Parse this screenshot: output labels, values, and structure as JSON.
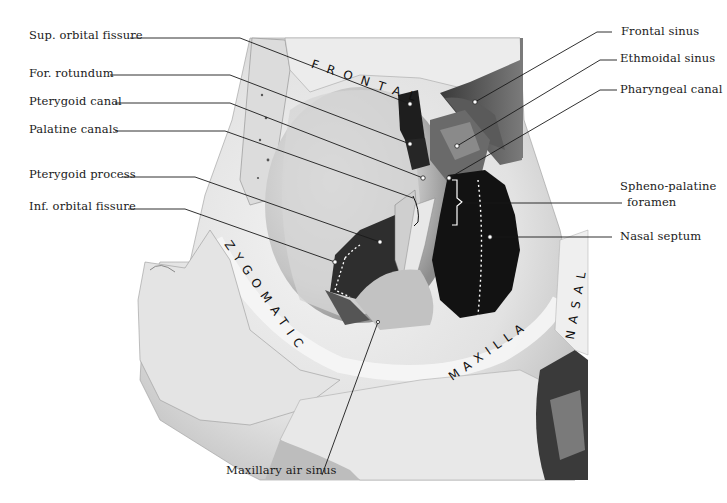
{
  "figure": {
    "type": "anatomical photograph"
  },
  "bone_labels": [
    {
      "id": "frontal",
      "text": "FRONTAL"
    },
    {
      "id": "zygomatic",
      "text": "ZYGOMATIC"
    },
    {
      "id": "maxilla",
      "text": "MAXILLA"
    },
    {
      "id": "nasal",
      "text": "NASAL"
    }
  ],
  "left_labels": [
    {
      "id": "sup-orbital-fissure",
      "text": "Sup. orbital fissure"
    },
    {
      "id": "for-rotundum",
      "text": "For. rotundum"
    },
    {
      "id": "pterygoid-canal",
      "text": "Pterygoid canal"
    },
    {
      "id": "palatine-canals",
      "text": "Palatine canals"
    },
    {
      "id": "pterygoid-process",
      "text": "Pterygoid process"
    },
    {
      "id": "inf-orbital-fissure",
      "text": "Inf. orbital fissure"
    }
  ],
  "right_labels": [
    {
      "id": "frontal-sinus",
      "text": "Frontal sinus"
    },
    {
      "id": "ethmoidal-sinus",
      "text": "Ethmoidal sinus"
    },
    {
      "id": "pharyngeal-canal",
      "text": "Pharyngeal canal"
    },
    {
      "id": "spheno-palatine-foramen-1",
      "text": "Spheno-palatine"
    },
    {
      "id": "spheno-palatine-foramen-2",
      "text": "foramen"
    },
    {
      "id": "nasal-septum",
      "text": "Nasal septum"
    }
  ],
  "bottom_labels": [
    {
      "id": "maxillary-air-sinus",
      "text": "Maxillary air sinus"
    }
  ],
  "colors": {
    "background": "#ffffff",
    "bone_light": "#ececec",
    "bone_mid": "#c8c8c8",
    "bone_shadow": "#8a8a8a",
    "cavity_dark": "#141414",
    "leader_line": "#1a1a1a",
    "label_text": "#1a1a1a"
  }
}
